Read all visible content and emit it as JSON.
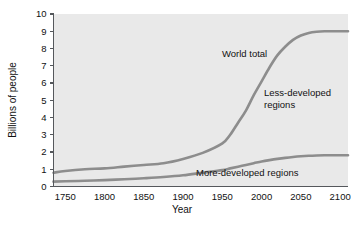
{
  "chart_data": {
    "type": "line",
    "title": "",
    "subtitle": "",
    "xlabel": "Year",
    "ylabel": "Billions of people",
    "xlim": [
      1735,
      2110
    ],
    "ylim": [
      0,
      10
    ],
    "grid": false,
    "legend_position": "inline-annotations",
    "xticks": [
      "1750",
      "1800",
      "1850",
      "1900",
      "1950",
      "2000",
      "2050",
      "2100"
    ],
    "xtick_values": [
      1750,
      1800,
      1850,
      1900,
      1950,
      2000,
      2050,
      2100
    ],
    "yticks": [
      "0",
      "1",
      "2",
      "3",
      "4",
      "5",
      "6",
      "7",
      "8",
      "9",
      "10"
    ],
    "ytick_values": [
      0,
      1,
      2,
      3,
      4,
      5,
      6,
      7,
      8,
      9,
      10
    ],
    "x": [
      1735,
      1750,
      1775,
      1800,
      1825,
      1850,
      1875,
      1900,
      1925,
      1950,
      1960,
      1970,
      1980,
      1990,
      2000,
      2010,
      2020,
      2030,
      2040,
      2050,
      2060,
      2070,
      2080,
      2090,
      2100,
      2110
    ],
    "series": [
      {
        "name": "World total",
        "color": "#8d8d8d",
        "values": [
          0.8,
          0.9,
          1.0,
          1.05,
          1.15,
          1.25,
          1.35,
          1.6,
          1.95,
          2.5,
          3.0,
          3.7,
          4.4,
          5.3,
          6.1,
          6.9,
          7.6,
          8.1,
          8.5,
          8.75,
          8.9,
          8.97,
          9.0,
          9.0,
          9.0,
          9.0
        ]
      },
      {
        "name": "More-developed regions",
        "color": "#8d8d8d",
        "values": [
          0.28,
          0.3,
          0.33,
          0.37,
          0.42,
          0.48,
          0.55,
          0.65,
          0.8,
          0.95,
          1.05,
          1.15,
          1.25,
          1.35,
          1.45,
          1.53,
          1.6,
          1.66,
          1.71,
          1.75,
          1.78,
          1.8,
          1.81,
          1.81,
          1.81,
          1.81
        ]
      }
    ],
    "annotations": [
      {
        "id": "world-total",
        "text": "World total",
        "x": 1975,
        "y": 7.8
      },
      {
        "id": "less-developed",
        "line1": "Less-developed",
        "line2": "regions",
        "x": 2035,
        "y": 6.0
      },
      {
        "id": "more-developed",
        "text": "More-developed regions",
        "x": 2010,
        "y": 1.0
      }
    ],
    "colors": {
      "plot_background": "#e9e9e9",
      "page_background": "#ffffff",
      "line": "#8d8d8d",
      "axis": "#55585c",
      "text": "#111111"
    }
  }
}
